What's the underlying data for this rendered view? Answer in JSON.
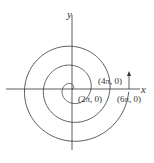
{
  "diagram": {
    "type": "archimedean-spiral",
    "axes": {
      "x_label": "x",
      "y_label": "y"
    },
    "points": [
      {
        "label": "(2π, 0)"
      },
      {
        "label": "(4π, 0)"
      },
      {
        "label": "(6π, 0)"
      }
    ],
    "colors": {
      "stroke": "#333333",
      "background": "#ffffff"
    }
  }
}
